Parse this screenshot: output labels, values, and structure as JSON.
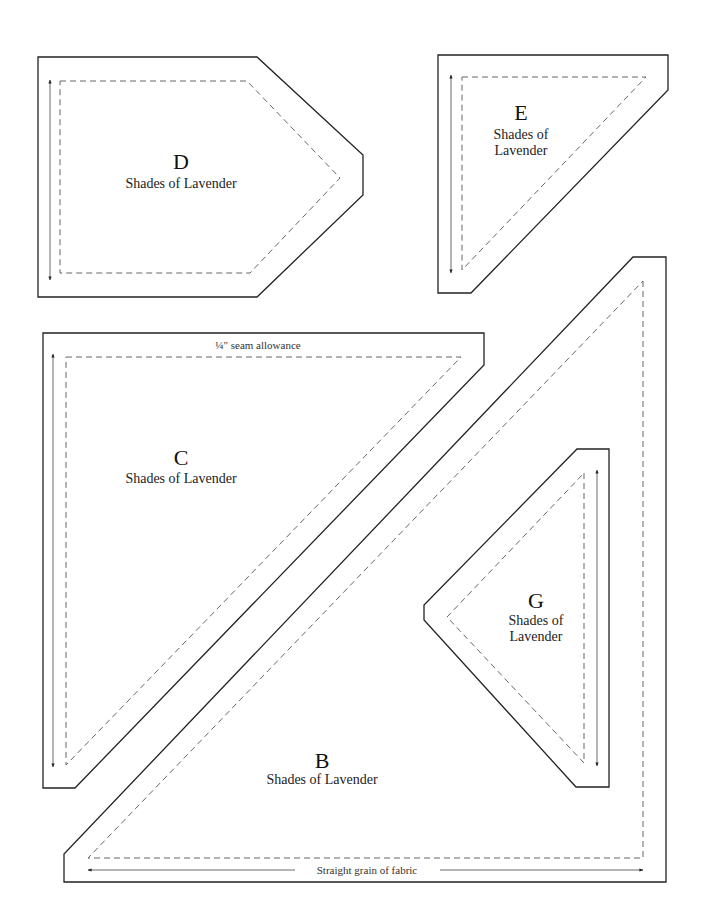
{
  "pieces": [
    {
      "id": "D",
      "letter": "D",
      "fabric_line1": "Shades of Lavender"
    },
    {
      "id": "E",
      "letter": "E",
      "fabric_line1": "Shades of",
      "fabric_line2": "Lavender"
    },
    {
      "id": "C",
      "letter": "C",
      "fabric_line1": "Shades of Lavender"
    },
    {
      "id": "G",
      "letter": "G",
      "fabric_line1": "Shades of",
      "fabric_line2": "Lavender"
    },
    {
      "id": "B",
      "letter": "B",
      "fabric_line1": "Shades of Lavender"
    }
  ],
  "annotations": {
    "seam_allowance_fraction": "1/4",
    "seam_allowance_label": "¼\" seam allowance",
    "grain_label": "Straight grain of fabric"
  },
  "colors": {
    "outline": "#222222",
    "seam_line": "#555555",
    "background": "#ffffff"
  }
}
